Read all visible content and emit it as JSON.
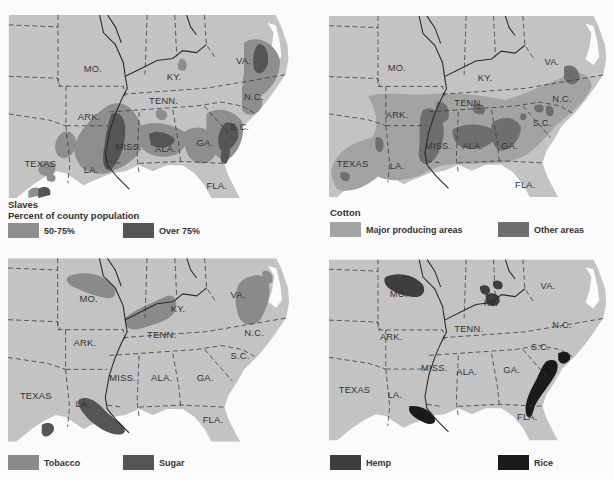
{
  "colors": {
    "land": "#c3c3c3",
    "water": "#ffffff",
    "background": "#fbfbfb",
    "border": "#3a3a3a",
    "slaves_50_75": "#8e8e8e",
    "slaves_over_75": "#555555",
    "cotton_major": "#a3a3a3",
    "cotton_other": "#6e6e6e",
    "tobacco": "#8a8a8a",
    "sugar": "#555555",
    "hemp": "#3e3e3e",
    "rice": "#1a1a1a"
  },
  "state_labels": [
    "MO.",
    "KY.",
    "VA.",
    "N.C.",
    "TENN.",
    "ARK.",
    "S.C.",
    "MISS.",
    "ALA.",
    "GA.",
    "TEXAS",
    "LA.",
    "FLA."
  ],
  "panels": [
    {
      "id": "slaves",
      "title": "Slaves",
      "subtitle": "Percent of county population",
      "legend": [
        {
          "label": "50-75%",
          "color_key": "slaves_50_75"
        },
        {
          "label": "Over 75%",
          "color_key": "slaves_over_75"
        }
      ]
    },
    {
      "id": "cotton",
      "title": "Cotton",
      "legend": [
        {
          "label": "Major producing areas",
          "color_key": "cotton_major"
        },
        {
          "label": "Other areas",
          "color_key": "cotton_other"
        }
      ]
    },
    {
      "id": "tobacco-sugar",
      "legend": [
        {
          "label": "Tobacco",
          "color_key": "tobacco"
        },
        {
          "label": "Sugar",
          "color_key": "sugar"
        }
      ]
    },
    {
      "id": "hemp-rice",
      "legend": [
        {
          "label": "Hemp",
          "color_key": "hemp"
        },
        {
          "label": "Rice",
          "color_key": "rice"
        }
      ]
    }
  ]
}
